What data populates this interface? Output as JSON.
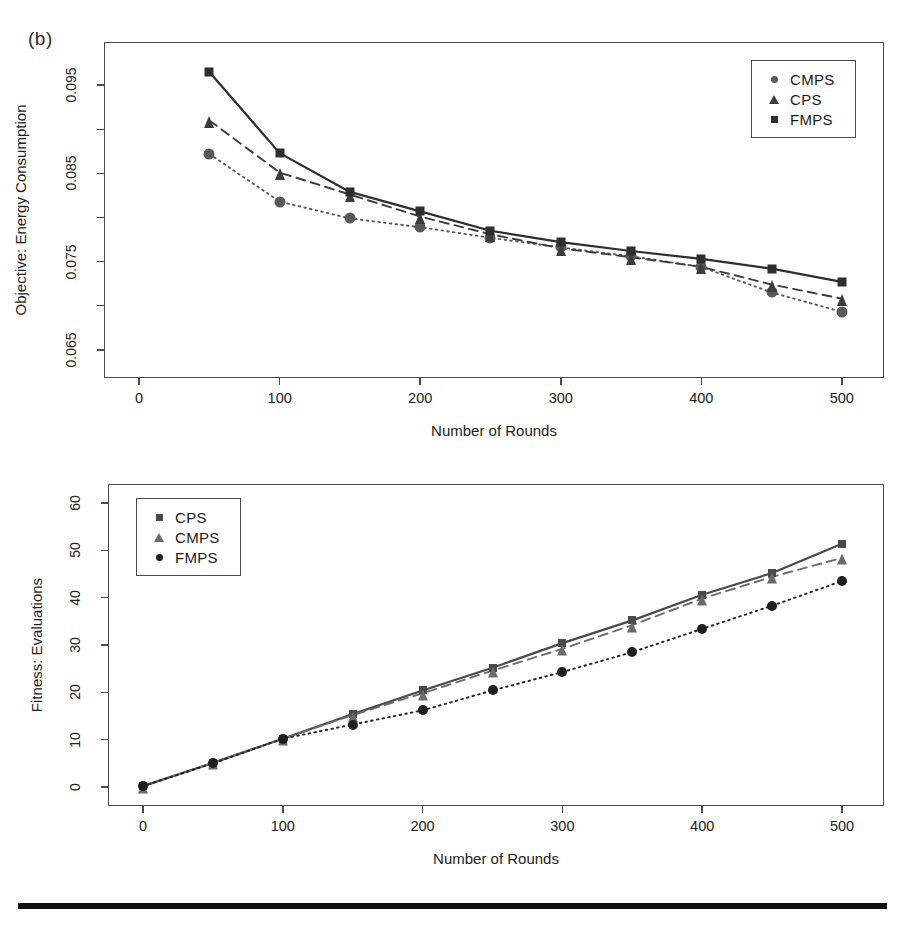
{
  "figure": {
    "panel_label": "(b)",
    "bottom_rule": true
  },
  "chart_data": [
    {
      "id": "top",
      "type": "line",
      "title": "",
      "xlabel": "Number of Rounds",
      "ylabel": "Objective: Energy Consumption",
      "x": [
        50,
        100,
        150,
        200,
        250,
        300,
        350,
        400,
        450,
        500
      ],
      "xlim": [
        -25,
        530
      ],
      "ylim": [
        0.0618,
        0.0999
      ],
      "xticks": [
        0,
        100,
        200,
        300,
        400,
        500
      ],
      "xtick_labels": [
        "0",
        "100",
        "200",
        "300",
        "400",
        "500"
      ],
      "yticks": [
        0.065,
        0.075,
        0.085,
        0.095
      ],
      "ytick_labels": [
        "0.065",
        "0.075",
        "0.085",
        "0.095"
      ],
      "yminor": [
        0.07,
        0.08,
        0.09,
        0.1
      ],
      "grid": false,
      "legend_position": "top-right",
      "series": [
        {
          "name": "CMPS",
          "marker": "circle",
          "linestyle": "dotted",
          "color": "#595959",
          "values": [
            0.0872,
            0.0818,
            0.0799,
            0.0789,
            0.0777,
            0.0766,
            0.0756,
            0.0744,
            0.0715,
            0.0693
          ]
        },
        {
          "name": "CPS",
          "marker": "triangle",
          "linestyle": "dashed",
          "color": "#3c3c3c",
          "values": [
            0.091,
            0.0851,
            0.0826,
            0.0801,
            0.0781,
            0.0765,
            0.0755,
            0.0744,
            0.0724,
            0.0708
          ]
        },
        {
          "name": "FMPS",
          "marker": "square",
          "linestyle": "solid",
          "color": "#2e2e2e",
          "values": [
            0.0965,
            0.0873,
            0.0829,
            0.0807,
            0.0785,
            0.0772,
            0.0762,
            0.0753,
            0.0742,
            0.0727
          ]
        }
      ],
      "legend": [
        {
          "label": "CMPS",
          "marker": "circle"
        },
        {
          "label": "CPS",
          "marker": "triangle"
        },
        {
          "label": "FMPS",
          "marker": "square"
        }
      ]
    },
    {
      "id": "bottom",
      "type": "line",
      "title": "",
      "xlabel": "Number of Rounds",
      "ylabel": "Fitness: Evaluations",
      "x": [
        0,
        50,
        100,
        150,
        200,
        250,
        300,
        350,
        400,
        450,
        500
      ],
      "xlim": [
        -25,
        530
      ],
      "ylim": [
        -4,
        64
      ],
      "xticks": [
        0,
        100,
        200,
        300,
        400,
        500
      ],
      "xtick_labels": [
        "0",
        "100",
        "200",
        "300",
        "400",
        "500"
      ],
      "yticks": [
        0,
        10,
        20,
        30,
        40,
        50,
        60
      ],
      "ytick_labels": [
        "0",
        "10",
        "20",
        "30",
        "40",
        "50",
        "60"
      ],
      "grid": false,
      "legend_position": "top-left",
      "series": [
        {
          "name": "CPS",
          "marker": "square",
          "linestyle": "solid",
          "color": "#4a4a4a",
          "values": [
            0.2,
            5.1,
            10.2,
            15.4,
            20.4,
            25.2,
            30.4,
            35.2,
            40.6,
            45.2,
            51.4
          ]
        },
        {
          "name": "CMPS",
          "marker": "triangle",
          "linestyle": "dashed",
          "color": "#6b6b6b",
          "values": [
            0.2,
            5.1,
            10.2,
            15.2,
            19.8,
            24.6,
            29.2,
            34.2,
            39.8,
            44.4,
            48.4
          ]
        },
        {
          "name": "FMPS",
          "marker": "circle",
          "linestyle": "dotted",
          "color": "#1f1f1f",
          "values": [
            0.2,
            5.0,
            10.2,
            13.2,
            16.2,
            20.4,
            24.3,
            28.5,
            33.4,
            38.3,
            43.5
          ]
        }
      ],
      "legend": [
        {
          "label": "CPS",
          "marker": "square"
        },
        {
          "label": "CMPS",
          "marker": "triangle"
        },
        {
          "label": "FMPS",
          "marker": "circle"
        }
      ]
    }
  ]
}
